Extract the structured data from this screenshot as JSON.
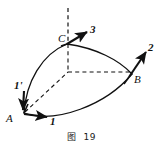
{
  "figure": {
    "caption_label": "图",
    "caption_number": "19",
    "ink_color": "#111111",
    "background_color": "#ffffff",
    "points": [
      {
        "id": "A",
        "label": "A",
        "x": 14,
        "y": 117
      },
      {
        "id": "B",
        "label": "B",
        "x": 134,
        "y": 77
      },
      {
        "id": "C",
        "label": "C",
        "x": 65,
        "y": 42
      }
    ],
    "vectors": [
      {
        "id": "1",
        "label": "1",
        "at_point": "A",
        "direction": "right",
        "label_x": 50,
        "label_y": 118
      },
      {
        "id": "1prime",
        "label": "1'",
        "at_point": "A",
        "direction": "down",
        "label_x": 15,
        "label_y": 84
      },
      {
        "id": "2",
        "label": "2",
        "at_point": "B",
        "direction": "up-right",
        "label_x": 149,
        "label_y": 47
      },
      {
        "id": "3",
        "label": "3",
        "at_point": "C",
        "direction": "up-right",
        "label_x": 91,
        "label_y": 29
      }
    ],
    "origin": {
      "x": 68,
      "y": 72
    },
    "solid_arcs": [
      {
        "id": "arc-A-C",
        "from": "A",
        "to": "C"
      },
      {
        "id": "arc-C-B",
        "from": "C",
        "to": "B"
      },
      {
        "id": "arc-A-B",
        "from": "A",
        "to": "B"
      }
    ],
    "dashed_lines": [
      {
        "id": "axis-vertical-above-C",
        "from": "C",
        "to": "above"
      },
      {
        "id": "edge-C-origin",
        "from": "C",
        "to": "origin"
      },
      {
        "id": "edge-origin-B",
        "from": "origin",
        "to": "B"
      },
      {
        "id": "edge-A-origin",
        "from": "A",
        "to": "origin"
      }
    ]
  }
}
